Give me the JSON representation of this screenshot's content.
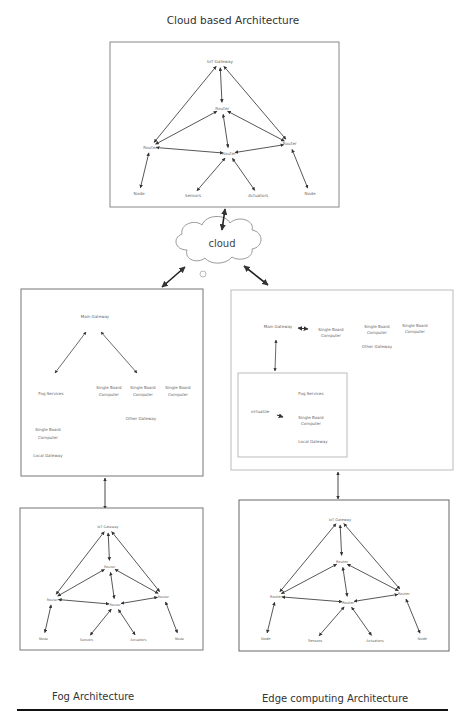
{
  "titles": {
    "top": "Cloud based Architecture",
    "fog": "Fog Architecture",
    "edge": "Edge computing Architecture"
  },
  "cloud": {
    "label": "cloud"
  },
  "iot_network": {
    "gateway": "IoT Gateway",
    "router": "Router",
    "node": "Node",
    "sensors": "Sensors",
    "actuators": "Actuators"
  },
  "fog_layer": {
    "main_gateway": "Main Gateway",
    "fog_services": "Fog Services",
    "single_board_computer": [
      "Single Board",
      "Computer"
    ],
    "other_gateway": "Other Gateway",
    "local_gateway": "Local Gateway"
  },
  "edge_layer": {
    "main_gateway": "Main Gateway",
    "single_board_computer": [
      "Single Board",
      "Computer"
    ],
    "other_gateway": "Other Gateway",
    "inner": {
      "virtualize": "virtualize",
      "fog_services": "Fog Services",
      "single_board_computer": [
        "Single Board",
        "Computer"
      ],
      "local_gateway": "Local Gateway"
    }
  },
  "colors": {
    "frame": "#888888",
    "arrow": "#333333",
    "text": "#666666",
    "rule": "#111111"
  }
}
